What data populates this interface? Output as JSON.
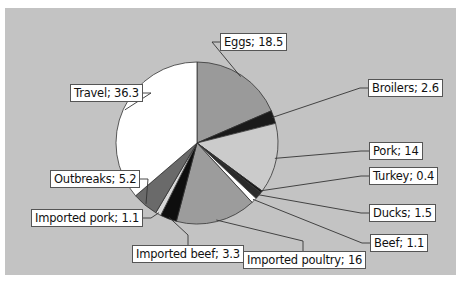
{
  "chart_data": {
    "type": "pie",
    "title": "",
    "slices": [
      {
        "label": "Eggs",
        "value": 18.5,
        "color": "#9a9a9a",
        "text": "Eggs; 18.5",
        "box": [
          215,
          25
        ],
        "anchor_side": "left"
      },
      {
        "label": "Broilers",
        "value": 2.6,
        "color": "#1a1a1a",
        "text": "Broilers; 2.6",
        "box": [
          363,
          71
        ],
        "anchor_side": "left"
      },
      {
        "label": "Pork",
        "value": 14,
        "color": "#cbcbcb",
        "text": "Pork; 14",
        "box": [
          364,
          134
        ],
        "anchor_side": "left"
      },
      {
        "label": "Turkey",
        "value": 0.4,
        "color": "#111111",
        "text": "Turkey; 0.4",
        "box": [
          364,
          159
        ],
        "anchor_side": "left"
      },
      {
        "label": "Ducks",
        "value": 1.5,
        "color": "#2a2a2a",
        "text": "Ducks; 1.5",
        "box": [
          364,
          196
        ],
        "anchor_side": "left"
      },
      {
        "label": "Beef",
        "value": 1.1,
        "color": "#ffffff",
        "text": "Beef; 1.1",
        "box": [
          365,
          226
        ],
        "anchor_side": "left"
      },
      {
        "label": "Imported poultry",
        "value": 16,
        "color": "#9c9c9c",
        "text": "Imported poultry; 16",
        "box": [
          238,
          243
        ],
        "anchor_side": "top"
      },
      {
        "label": "Imported beef",
        "value": 3.3,
        "color": "#0e0e0e",
        "text": "Imported beef; 3.3",
        "box": [
          127,
          237
        ],
        "anchor_side": "top"
      },
      {
        "label": "Imported pork",
        "value": 1.1,
        "color": "#d8d8d8",
        "text": "Imported pork; 1.1",
        "box": [
          26,
          201
        ],
        "anchor_side": "right"
      },
      {
        "label": "Outbreaks",
        "value": 5.2,
        "color": "#6a6a6a",
        "text": "Outbreaks; 5.2",
        "box": [
          45,
          162
        ],
        "anchor_side": "right"
      },
      {
        "label": "Travel",
        "value": 36.3,
        "color": "#ffffff",
        "text": "Travel; 36.3",
        "box": [
          65,
          76
        ],
        "anchor_side": "right"
      }
    ],
    "total": 99.9,
    "start_angle_deg": 0,
    "direction": "clockwise",
    "center": [
      192,
      135
    ],
    "radius": 81,
    "legend": "none",
    "data_labels": "label; value with leader lines",
    "background": "#c3c3c3"
  }
}
